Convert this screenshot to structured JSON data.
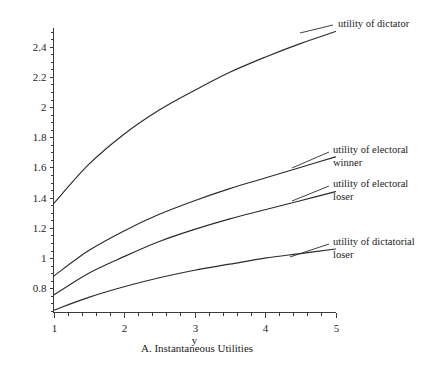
{
  "figure": {
    "caption": "A. Instantaneous Utilities",
    "x_axis_name": "y"
  },
  "annotations": {
    "dictator": "utility of dictator",
    "electoral_winner_line1": "utility of electoral",
    "electoral_winner_line2": "winner",
    "electoral_loser_line1": "utility of electoral",
    "electoral_loser_line2": "loser",
    "dictatorial_loser_line1": "utility of dictatorial",
    "dictatorial_loser_line2": "loser"
  },
  "axis_labels": {
    "y": [
      "0.8",
      "1",
      "1.2",
      "1.4",
      "1.6",
      "1.8",
      "2",
      "2.2",
      "2.4"
    ],
    "x": [
      "1",
      "2",
      "3",
      "4",
      "5"
    ]
  },
  "chart_data": {
    "type": "line",
    "title": "",
    "subtitle": "",
    "xlabel": "y",
    "ylabel": "",
    "caption": "A. Instantaneous Utilities",
    "grid": false,
    "legend_position": "inline-annotations",
    "xlim": [
      1,
      5
    ],
    "ylim": [
      0.64,
      2.52
    ],
    "xticks": [
      1,
      2,
      3,
      4,
      5
    ],
    "yticks": [
      0.8,
      1,
      1.2,
      1.4,
      1.6,
      1.8,
      2,
      2.2,
      2.4
    ],
    "minor_ticks": true,
    "x": [
      1,
      1.5,
      2,
      2.5,
      3,
      3.5,
      4,
      4.5,
      5
    ],
    "series": [
      {
        "name": "utility of dictator",
        "color": "#2b2b2b",
        "values": [
          1.36,
          1.62,
          1.82,
          1.98,
          2.11,
          2.23,
          2.33,
          2.42,
          2.5
        ]
      },
      {
        "name": "utility of electoral winner",
        "color": "#2b2b2b",
        "values": [
          0.88,
          1.05,
          1.18,
          1.29,
          1.38,
          1.46,
          1.53,
          1.6,
          1.67
        ]
      },
      {
        "name": "utility of electoral loser",
        "color": "#2b2b2b",
        "values": [
          0.755,
          0.9,
          1.01,
          1.11,
          1.19,
          1.26,
          1.32,
          1.38,
          1.44
        ]
      },
      {
        "name": "utility of dictatorial loser",
        "color": "#2b2b2b",
        "values": [
          0.655,
          0.74,
          0.81,
          0.87,
          0.92,
          0.96,
          1.0,
          1.03,
          1.06
        ]
      }
    ]
  }
}
